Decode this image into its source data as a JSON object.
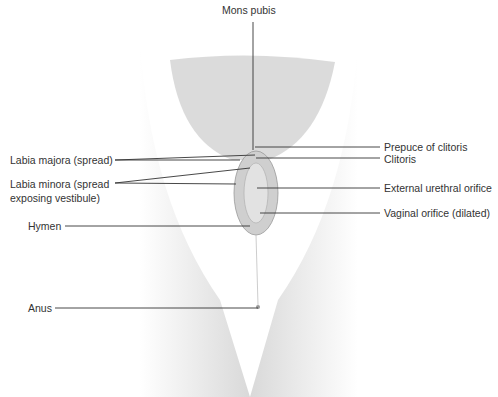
{
  "figure": {
    "type": "anatomical-diagram",
    "style": "grayscale line illustration",
    "labels": {
      "mons_pubis": "Mons pubis",
      "labia_majora": "Labia majora (spread)",
      "labia_minora_line1": "Labia minora (spread",
      "labia_minora_line2": "exposing vestibule)",
      "hymen": "Hymen",
      "anus": "Anus",
      "prepuce": "Prepuce of clitoris",
      "clitoris": "Clitoris",
      "urethral_orifice": "External urethral orifice",
      "vaginal_orifice": "Vaginal orifice (dilated)"
    }
  }
}
